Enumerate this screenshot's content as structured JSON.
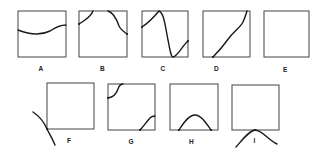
{
  "figure": {
    "panels": [
      {
        "id": "A",
        "label": "A",
        "description": "gentle wave crossing box from left edge to right edge"
      },
      {
        "id": "B",
        "label": "B",
        "description": "two arcs in top corners touching top edge"
      },
      {
        "id": "C",
        "label": "C",
        "description": "S-shaped curve touching top and bottom edges"
      },
      {
        "id": "D",
        "label": "D",
        "description": "curve rising from bottom-left to top-right corner"
      },
      {
        "id": "E",
        "label": "E",
        "description": "empty box"
      },
      {
        "id": "F",
        "label": "F",
        "description": "curve passing outside box through bottom-left corner"
      },
      {
        "id": "G",
        "label": "G",
        "description": "arcs at top-left and bottom-right corners"
      },
      {
        "id": "H",
        "label": "H",
        "description": "hump resting on bottom edge inside box"
      },
      {
        "id": "I",
        "label": "I",
        "description": "hump below box touching bottom edge at one point"
      }
    ]
  },
  "colors": {
    "box": "#555555",
    "curve": "#1a1a1a",
    "background": "#ffffff"
  }
}
